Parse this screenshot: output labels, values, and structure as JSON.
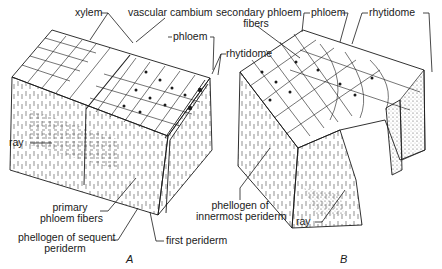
{
  "figure": {
    "panels": [
      {
        "id": "A",
        "caption": "A",
        "labels": {
          "xylem": "xylem",
          "vascular_cambium": "vascular cambium",
          "phloem": "phloem",
          "rhytidome": "rhytidome",
          "ray": "ray",
          "primary_phloem_fibers_1": "primary",
          "primary_phloem_fibers_2": "phloem fibers",
          "phellogen_sequent_1": "phellogen of sequent",
          "phellogen_sequent_2": "periderm",
          "first_periderm": "first periderm"
        }
      },
      {
        "id": "B",
        "caption": "B",
        "labels": {
          "secondary_phloem_fibers_1": "secondary phloem",
          "secondary_phloem_fibers_2": "fibers",
          "phloem": "phloem",
          "rhytidome": "rhytidome",
          "phellogen_innermost_1": "phellogen of",
          "phellogen_innermost_2": "innermost periderm",
          "ray": "ray"
        }
      }
    ],
    "colors": {
      "ink": "#1a1a1a",
      "background": "#ffffff",
      "stipple": "#9a9a9a"
    }
  }
}
